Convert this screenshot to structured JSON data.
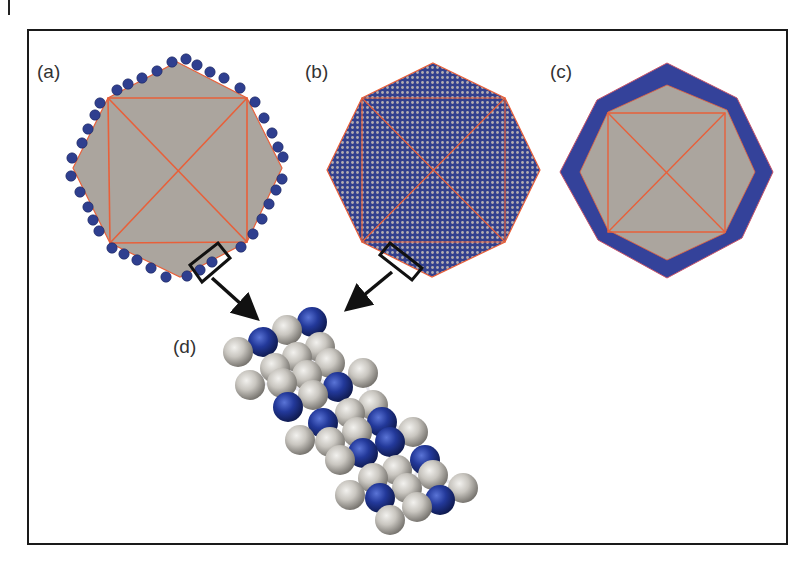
{
  "figure": {
    "width": 812,
    "height": 571,
    "frame": {
      "x": 28,
      "y": 30,
      "width": 759,
      "height": 514,
      "stroke": "#1a1a1a"
    },
    "margin_mark": {
      "x": 9,
      "y1": 0,
      "y2": 15
    },
    "colors": {
      "gray_face": "#aba59e",
      "edge_red": "#e8603a",
      "blue_atom": "#2f3f8f",
      "blue_shell": "#34429a",
      "pattern_dot": "#b3adb0",
      "sphere_gray": "#c9c6c0",
      "sphere_blue": "#23399a"
    }
  },
  "panels": {
    "a": {
      "label": "(a)",
      "label_pos": [
        37,
        78
      ],
      "description": "Octahedral particle with adsorbed surface atoms along the perimeter",
      "octagon": [
        [
          177,
          62
        ],
        [
          247,
          98
        ],
        [
          282,
          168
        ],
        [
          247,
          242
        ],
        [
          180,
          277
        ],
        [
          110,
          243
        ],
        [
          73,
          168
        ],
        [
          108,
          98
        ]
      ],
      "square": [
        [
          108,
          98
        ],
        [
          247,
          98
        ],
        [
          247,
          242
        ],
        [
          110,
          243
        ]
      ],
      "perimeter_atoms": [
        [
          117,
          90
        ],
        [
          128,
          84
        ],
        [
          142,
          78
        ],
        [
          157,
          71
        ],
        [
          172,
          62
        ],
        [
          186,
          59
        ],
        [
          197,
          65
        ],
        [
          210,
          72
        ],
        [
          224,
          78
        ],
        [
          240,
          88
        ],
        [
          255,
          102
        ],
        [
          264,
          118
        ],
        [
          272,
          133
        ],
        [
          278,
          147
        ],
        [
          283,
          157
        ],
        [
          282,
          179
        ],
        [
          276,
          190
        ],
        [
          269,
          204
        ],
        [
          262,
          219
        ],
        [
          253,
          234
        ],
        [
          241,
          247
        ],
        [
          212,
          262
        ],
        [
          200,
          270
        ],
        [
          187,
          276
        ],
        [
          166,
          277
        ],
        [
          151,
          268
        ],
        [
          137,
          260
        ],
        [
          124,
          254
        ],
        [
          112,
          248
        ],
        [
          99,
          231
        ],
        [
          93,
          220
        ],
        [
          88,
          207
        ],
        [
          80,
          192
        ],
        [
          71,
          176
        ],
        [
          72,
          158
        ],
        [
          82,
          143
        ],
        [
          88,
          129
        ],
        [
          95,
          115
        ],
        [
          100,
          103
        ]
      ],
      "zoom_box": [
        [
          190,
          265
        ],
        [
          218,
          243
        ],
        [
          230,
          258
        ],
        [
          202,
          282
        ]
      ],
      "arrow": {
        "from": [
          212,
          278
        ],
        "to": [
          258,
          320
        ]
      }
    },
    "b": {
      "label": "(b)",
      "label_pos": [
        305,
        78
      ],
      "description": "Octahedral particle with fully covered surface (dot lattice)",
      "octagon": [
        [
          433,
          63
        ],
        [
          505,
          98
        ],
        [
          540,
          170
        ],
        [
          505,
          242
        ],
        [
          432,
          277
        ],
        [
          362,
          242
        ],
        [
          327,
          170
        ],
        [
          362,
          98
        ]
      ],
      "square": [
        [
          362,
          98
        ],
        [
          505,
          98
        ],
        [
          505,
          242
        ],
        [
          362,
          242
        ]
      ],
      "zoom_box": [
        [
          380,
          255
        ],
        [
          390,
          243
        ],
        [
          422,
          268
        ],
        [
          412,
          280
        ]
      ],
      "arrow": {
        "from": [
          392,
          272
        ],
        "to": [
          346,
          310
        ]
      }
    },
    "c": {
      "label": "(c)",
      "label_pos": [
        550,
        78
      ],
      "description": "Octahedral particle with continuous surface shell",
      "outer_octagon": [
        [
          667,
          63
        ],
        [
          737,
          98
        ],
        [
          773,
          172
        ],
        [
          742,
          238
        ],
        [
          667,
          278
        ],
        [
          598,
          240
        ],
        [
          560,
          172
        ],
        [
          597,
          100
        ]
      ],
      "inner_octagon": [
        [
          667,
          85
        ],
        [
          727,
          110
        ],
        [
          755,
          172
        ],
        [
          725,
          233
        ],
        [
          667,
          260
        ],
        [
          608,
          230
        ],
        [
          580,
          172
        ],
        [
          608,
          112
        ]
      ],
      "square": [
        [
          608,
          113
        ],
        [
          725,
          113
        ],
        [
          725,
          232
        ],
        [
          608,
          232
        ]
      ]
    },
    "d": {
      "label": "(d)",
      "label_pos": [
        173,
        353
      ],
      "description": "Atomistic close-up of the surface layer: gray host atoms and blue adsorbate atoms",
      "sphere_radius": 15,
      "spheres": [
        {
          "x": 312,
          "y": 322,
          "type": "blue"
        },
        {
          "x": 287,
          "y": 330,
          "type": "gray"
        },
        {
          "x": 320,
          "y": 347,
          "type": "gray"
        },
        {
          "x": 263,
          "y": 342,
          "type": "blue"
        },
        {
          "x": 238,
          "y": 352,
          "type": "gray"
        },
        {
          "x": 297,
          "y": 357,
          "type": "gray"
        },
        {
          "x": 330,
          "y": 363,
          "type": "gray"
        },
        {
          "x": 363,
          "y": 373,
          "type": "gray"
        },
        {
          "x": 275,
          "y": 368,
          "type": "gray"
        },
        {
          "x": 307,
          "y": 375,
          "type": "gray"
        },
        {
          "x": 250,
          "y": 385,
          "type": "gray"
        },
        {
          "x": 338,
          "y": 387,
          "type": "blue"
        },
        {
          "x": 282,
          "y": 383,
          "type": "gray"
        },
        {
          "x": 313,
          "y": 395,
          "type": "gray"
        },
        {
          "x": 373,
          "y": 405,
          "type": "gray"
        },
        {
          "x": 288,
          "y": 407,
          "type": "blue"
        },
        {
          "x": 350,
          "y": 413,
          "type": "gray"
        },
        {
          "x": 382,
          "y": 422,
          "type": "blue"
        },
        {
          "x": 323,
          "y": 423,
          "type": "blue"
        },
        {
          "x": 413,
          "y": 432,
          "type": "gray"
        },
        {
          "x": 357,
          "y": 432,
          "type": "gray"
        },
        {
          "x": 300,
          "y": 440,
          "type": "gray"
        },
        {
          "x": 390,
          "y": 442,
          "type": "blue"
        },
        {
          "x": 330,
          "y": 442,
          "type": "gray"
        },
        {
          "x": 363,
          "y": 453,
          "type": "blue"
        },
        {
          "x": 340,
          "y": 460,
          "type": "gray"
        },
        {
          "x": 425,
          "y": 460,
          "type": "blue"
        },
        {
          "x": 397,
          "y": 470,
          "type": "gray"
        },
        {
          "x": 433,
          "y": 475,
          "type": "gray"
        },
        {
          "x": 373,
          "y": 478,
          "type": "gray"
        },
        {
          "x": 463,
          "y": 488,
          "type": "gray"
        },
        {
          "x": 407,
          "y": 488,
          "type": "gray"
        },
        {
          "x": 350,
          "y": 495,
          "type": "gray"
        },
        {
          "x": 440,
          "y": 500,
          "type": "blue"
        },
        {
          "x": 380,
          "y": 498,
          "type": "blue"
        },
        {
          "x": 417,
          "y": 507,
          "type": "gray"
        },
        {
          "x": 390,
          "y": 520,
          "type": "gray"
        }
      ]
    }
  }
}
